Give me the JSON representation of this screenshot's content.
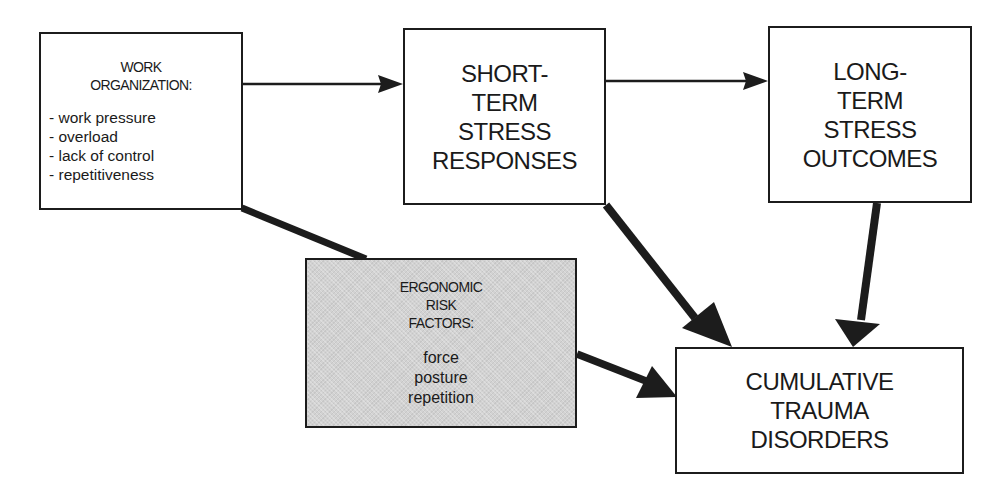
{
  "diagram": {
    "nodes": {
      "work_organization": {
        "title_lines": [
          "WORK",
          "ORGANIZATION:"
        ],
        "items": [
          "- work pressure",
          "- overload",
          "- lack of control",
          "- repetitiveness"
        ]
      },
      "short_term": {
        "title_lines": [
          "SHORT-",
          "TERM",
          "STRESS",
          "RESPONSES"
        ]
      },
      "long_term": {
        "title_lines": [
          "LONG-",
          "TERM",
          "STRESS",
          "OUTCOMES"
        ]
      },
      "ergonomic": {
        "title_lines": [
          "ERGONOMIC",
          "RISK",
          "FACTORS:"
        ],
        "items": [
          "force",
          "posture",
          "repetition"
        ]
      },
      "ctd": {
        "title_lines": [
          "CUMULATIVE",
          "TRAUMA",
          "DISORDERS"
        ]
      }
    },
    "edges": [
      {
        "from": "work_organization",
        "to": "short_term",
        "style": "thin"
      },
      {
        "from": "short_term",
        "to": "long_term",
        "style": "thin"
      },
      {
        "from": "work_organization",
        "to": "ergonomic",
        "style": "thick-line"
      },
      {
        "from": "short_term",
        "to": "ctd",
        "style": "thick"
      },
      {
        "from": "long_term",
        "to": "ctd",
        "style": "thick"
      },
      {
        "from": "ergonomic",
        "to": "ctd",
        "style": "thick"
      }
    ],
    "colors": {
      "stroke": "#1c1c1c",
      "shaded_fill": "#d2d2d2",
      "background": "#ffffff"
    }
  }
}
